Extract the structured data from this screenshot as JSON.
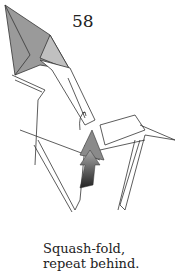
{
  "diagram": {
    "step_number": "58",
    "caption_line1": "Squash-fold,",
    "caption_line2": "repeat behind.",
    "colors": {
      "paper_colored": "#9a9a9a",
      "paper_white": "#ffffff",
      "line": "#333333",
      "arrow_dark": "#444444"
    }
  }
}
